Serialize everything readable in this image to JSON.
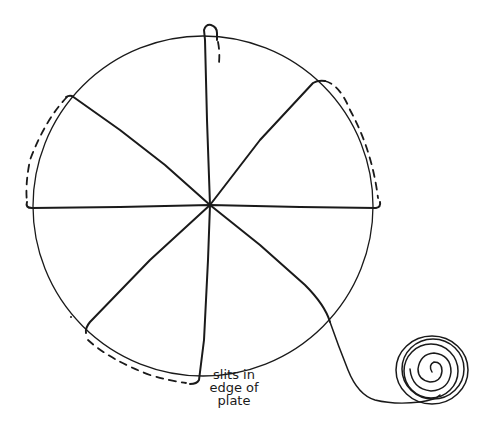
{
  "diagram": {
    "title": "",
    "colors": {
      "line": "#1a1a1a",
      "background": "#ffffff"
    },
    "elements": {
      "plate": "circle",
      "spokes": 7,
      "yarn_ball": "spiral"
    },
    "label": {
      "lines": [
        "slits in",
        "edge of",
        "plate"
      ]
    }
  }
}
